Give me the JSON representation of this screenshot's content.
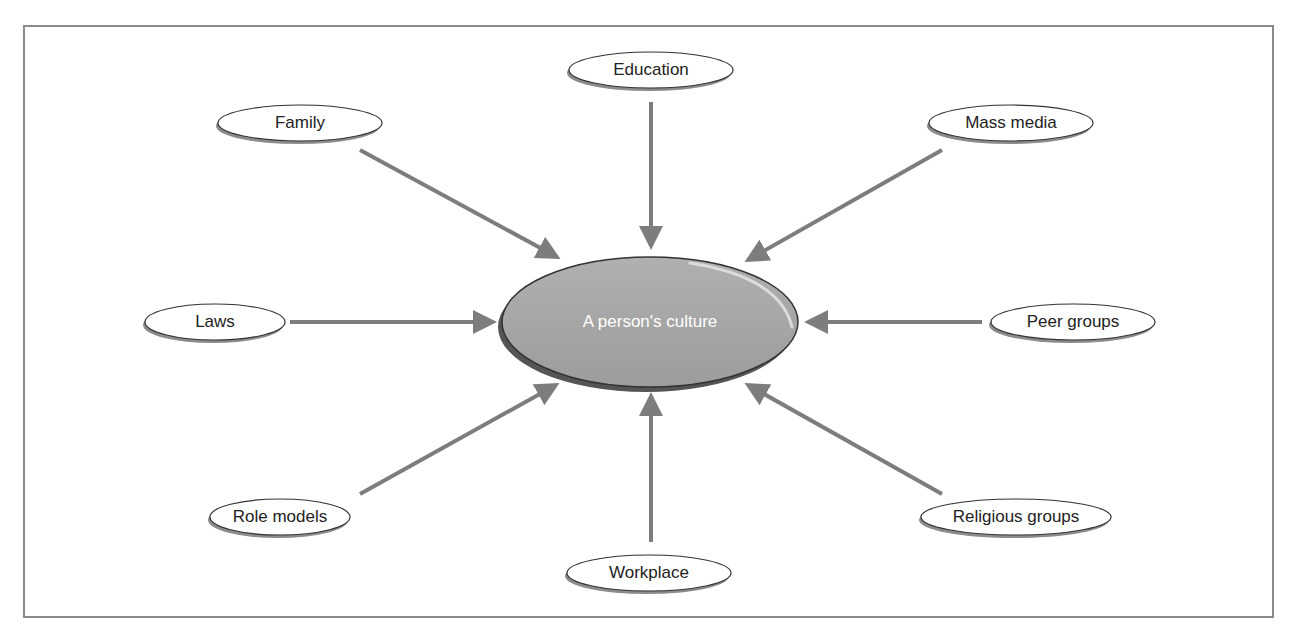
{
  "diagram": {
    "center": {
      "label": "A person's culture",
      "fill": "#a4a4a4",
      "cx": 650,
      "cy": 322,
      "rx": 148,
      "ry": 65
    },
    "influences": [
      {
        "id": "education",
        "label": "Education",
        "cx": 651,
        "cy": 70,
        "rx": 82,
        "ry": 18,
        "from": [
          651,
          102
        ],
        "to": [
          651,
          246
        ]
      },
      {
        "id": "family",
        "label": "Family",
        "cx": 300,
        "cy": 123,
        "rx": 82,
        "ry": 18,
        "from": [
          360,
          150
        ],
        "to": [
          557,
          257
        ]
      },
      {
        "id": "mass-media",
        "label": "Mass media",
        "cx": 1011,
        "cy": 123,
        "rx": 82,
        "ry": 18,
        "from": [
          942,
          150
        ],
        "to": [
          748,
          260
        ]
      },
      {
        "id": "laws",
        "label": "Laws",
        "cx": 215,
        "cy": 322,
        "rx": 70,
        "ry": 18,
        "from": [
          290,
          322
        ],
        "to": [
          493,
          322
        ]
      },
      {
        "id": "peer-groups",
        "label": "Peer groups",
        "cx": 1073,
        "cy": 322,
        "rx": 82,
        "ry": 18,
        "from": [
          982,
          322
        ],
        "to": [
          808,
          322
        ]
      },
      {
        "id": "role-models",
        "label": "Role models",
        "cx": 280,
        "cy": 517,
        "rx": 70,
        "ry": 18,
        "from": [
          360,
          494
        ],
        "to": [
          556,
          385
        ]
      },
      {
        "id": "religious",
        "label": "Religious groups",
        "cx": 1016,
        "cy": 517,
        "rx": 95,
        "ry": 18,
        "from": [
          942,
          494
        ],
        "to": [
          748,
          385
        ]
      },
      {
        "id": "workplace",
        "label": "Workplace",
        "cx": 649,
        "cy": 573,
        "rx": 82,
        "ry": 18,
        "from": [
          651,
          542
        ],
        "to": [
          651,
          396
        ]
      }
    ],
    "colors": {
      "arrow": "#7d7d7d",
      "node_stroke": "#333333",
      "node_shadow": "#8c8c8c",
      "frame": "#8a8a8a"
    }
  }
}
